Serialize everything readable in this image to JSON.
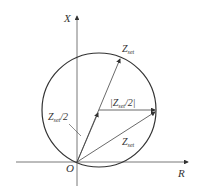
{
  "diagram": {
    "axes": {
      "x_axis_label": "R",
      "y_axis_label": "X",
      "origin_label": "O"
    },
    "labels": {
      "zset_top": "Z",
      "zset_top_sub": "set",
      "zset_half_left": "Z",
      "zset_half_left_sub": "set",
      "zset_half_left_suffix": "/2",
      "radius_label_open": "|Z",
      "radius_label_sub": "set",
      "radius_label_close": "/2|",
      "zset_bottom": "Z",
      "zset_bottom_sub": "set"
    },
    "colors": {
      "line": "#333333",
      "background": "#ffffff"
    }
  }
}
